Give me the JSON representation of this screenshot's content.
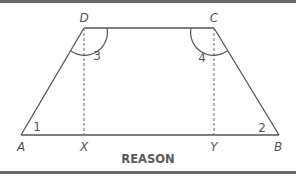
{
  "diagram": {
    "type": "trapezoid",
    "caption": "REASON",
    "colors": {
      "line": "#555555",
      "border": "#6b6b6b",
      "dashed": "#777777",
      "caption": "#5a5a5a",
      "background": "#ffffff"
    },
    "vertices": {
      "A": {
        "label": "A",
        "x": 21,
        "y": 135
      },
      "B": {
        "label": "B",
        "x": 279,
        "y": 135
      },
      "C": {
        "label": "C",
        "x": 214,
        "y": 28
      },
      "D": {
        "label": "D",
        "x": 84,
        "y": 28
      },
      "X": {
        "label": "X",
        "x": 84,
        "y": 135
      },
      "Y": {
        "label": "Y",
        "x": 214,
        "y": 135
      }
    },
    "segments": {
      "solid": [
        "AB",
        "BC",
        "CD",
        "DA"
      ],
      "dashed": [
        "DX",
        "CY"
      ]
    },
    "angles": [
      {
        "label": "1",
        "vertex": "A"
      },
      {
        "label": "2",
        "vertex": "B"
      },
      {
        "label": "3",
        "vertex": "D",
        "arc": true
      },
      {
        "label": "4",
        "vertex": "C",
        "arc": true
      }
    ]
  }
}
